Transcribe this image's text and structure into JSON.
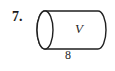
{
  "figure": {
    "kind": "geometry-figure",
    "shape": "cylinder",
    "problem_number": "7.",
    "volume_label": "V",
    "length_label": "8",
    "stroke_color": "#1f1f1f",
    "fill_color": "#ffffff",
    "background_color": "#ffffff",
    "geometry": {
      "left_ellipse_center_x": 45,
      "left_ellipse_center_y": 30,
      "ellipse_radius_x": 8,
      "ellipse_radius_y": 19,
      "right_end_x": 98,
      "top_line_y": 11,
      "bottom_line_y": 49,
      "stroke_width": 1.4
    }
  }
}
